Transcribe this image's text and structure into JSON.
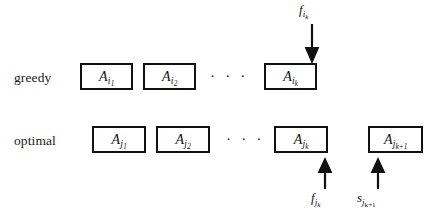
{
  "figure": {
    "background_color": "#ffffff",
    "stroke_color": "#111111",
    "text_color": "#1a1a1a"
  },
  "rows": [
    {
      "name": "greedy",
      "label": "greedy",
      "boxes": [
        {
          "base": "A",
          "sub": "i",
          "subsub": "1"
        },
        {
          "base": "A",
          "sub": "i",
          "subsub": "2"
        },
        {
          "base": "A",
          "sub": "i",
          "subsub": "k"
        }
      ],
      "ellipsis": "· · ·"
    },
    {
      "name": "optimal",
      "label": "optimal",
      "boxes": [
        {
          "base": "A",
          "sub": "j",
          "subsub": "1"
        },
        {
          "base": "A",
          "sub": "j",
          "subsub": "2"
        },
        {
          "base": "A",
          "sub": "j",
          "subsub": "k"
        },
        {
          "base": "A",
          "sub": "j",
          "subsub": "k+1"
        }
      ],
      "ellipsis": "· · ·"
    }
  ],
  "annotations": [
    {
      "name": "finish-time-greedy-k",
      "base": "f",
      "sub": "i",
      "subsub": "k",
      "direction": "down",
      "points_to": "A_i_k"
    },
    {
      "name": "finish-time-optimal-k",
      "base": "f",
      "sub": "j",
      "subsub": "k",
      "direction": "up",
      "points_to": "A_j_k"
    },
    {
      "name": "start-time-optimal-k-plus-1",
      "base": "s",
      "sub": "j",
      "subsub": "k+1",
      "direction": "up",
      "points_to": "A_j_k+1"
    }
  ]
}
